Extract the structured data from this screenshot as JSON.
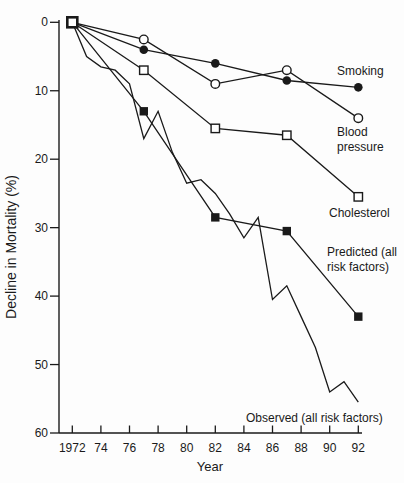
{
  "figure": {
    "background": "#fdfdfd",
    "ink_color": "#1a1a1a"
  },
  "chart_data": {
    "type": "line",
    "title": "",
    "xlabel": "Year",
    "ylabel": "Decline in Mortality (%)",
    "xlim": [
      1971,
      1993
    ],
    "ylim": [
      0,
      60
    ],
    "y_axis_inverted": true,
    "grid": false,
    "legend_position": "inline-labels",
    "x_ticks": [
      1972,
      1974,
      1976,
      1978,
      1980,
      1982,
      1984,
      1986,
      1988,
      1990,
      1992
    ],
    "x_tick_labels": [
      "1972",
      "74",
      "76",
      "78",
      "80",
      "82",
      "84",
      "86",
      "88",
      "90",
      "92"
    ],
    "y_ticks": [
      0,
      10,
      20,
      30,
      40,
      50,
      60
    ],
    "y_tick_labels": [
      "0",
      "10",
      "20",
      "30",
      "40",
      "50",
      "60"
    ],
    "origin_marker": "bold-open-square",
    "series": [
      {
        "name": "Smoking",
        "marker": "filled-circle",
        "line": "solid",
        "x": [
          1972,
          1977,
          1982,
          1987,
          1992
        ],
        "values": [
          0,
          4,
          6,
          8.5,
          9.5
        ],
        "label_lines": [
          "Smoking"
        ]
      },
      {
        "name": "Blood pressure",
        "marker": "open-circle",
        "line": "solid",
        "x": [
          1972,
          1977,
          1982,
          1987,
          1992
        ],
        "values": [
          0,
          2.5,
          9,
          7,
          14
        ],
        "label_lines": [
          "Blood",
          "pressure"
        ]
      },
      {
        "name": "Cholesterol",
        "marker": "open-square",
        "line": "solid",
        "x": [
          1972,
          1977,
          1982,
          1987,
          1992
        ],
        "values": [
          0,
          7,
          15.5,
          16.5,
          25.5
        ],
        "label_lines": [
          "Cholesterol"
        ]
      },
      {
        "name": "Predicted (all risk factors)",
        "marker": "filled-square",
        "line": "solid",
        "x": [
          1972,
          1977,
          1982,
          1987,
          1992
        ],
        "values": [
          0,
          13,
          28.5,
          30.5,
          43
        ],
        "label_lines": [
          "Predicted (all",
          "risk factors)"
        ]
      },
      {
        "name": "Observed (all risk factors)",
        "marker": "none",
        "line": "solid",
        "x": [
          1972,
          1973,
          1974,
          1975,
          1976,
          1977,
          1978,
          1979,
          1980,
          1981,
          1982,
          1983,
          1984,
          1985,
          1986,
          1987,
          1988,
          1989,
          1990,
          1991,
          1992
        ],
        "values": [
          0,
          5,
          6.5,
          7,
          9,
          17,
          13,
          19,
          23.5,
          23,
          25,
          28,
          31.5,
          28.5,
          40.5,
          38.5,
          43,
          47.5,
          54,
          52.5,
          55.5
        ],
        "label_lines": [
          "Observed (all risk factors)"
        ]
      }
    ]
  }
}
